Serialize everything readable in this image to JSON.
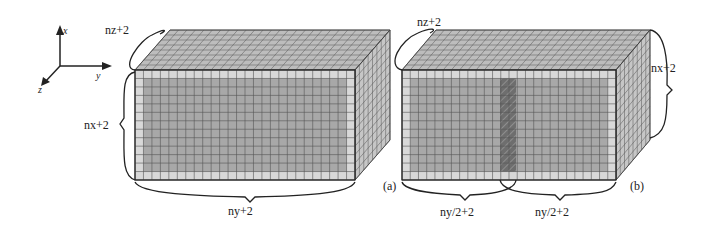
{
  "figure": {
    "axes": {
      "x_label": "x",
      "y_label": "y",
      "z_label": "z"
    },
    "panel_a": {
      "caption": "(a)",
      "dim_z_label": "nz+2",
      "dim_x_label": "nx+2",
      "dim_y_label": "ny+2"
    },
    "panel_b": {
      "caption": "(b)",
      "dim_z_label": "nz+2",
      "dim_x_label": "nx+2",
      "dim_y_left_label": "ny/2+2",
      "dim_y_right_label": "ny/2+2",
      "overlap_region": "hatched strip"
    },
    "colors": {
      "grid_line": "#555555",
      "ghost_fill": "#d8d8d8",
      "interior_fill": "#a8a8a8",
      "top_fill": "#bdbdbd",
      "side_fill": "#c6c6c6",
      "overlap_fill": "#6e6e6e",
      "stroke": "#222222"
    }
  }
}
